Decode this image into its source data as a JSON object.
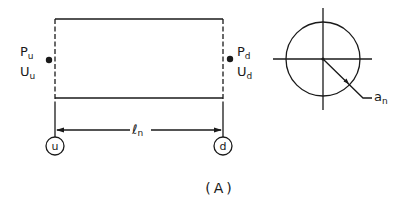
{
  "figure": {
    "caption": "(A)",
    "upstream": {
      "pressure_label": "P",
      "pressure_sub": "u",
      "velocity_label": "U",
      "velocity_sub": "u",
      "node_label": "u"
    },
    "downstream": {
      "pressure_label": "P",
      "pressure_sub": "d",
      "velocity_label": "U",
      "velocity_sub": "d",
      "node_label": "d"
    },
    "length_label": "ℓ",
    "length_sub": "n",
    "cross_section": {
      "radius_label": "a",
      "radius_sub": "n"
    }
  },
  "colors": {
    "ink": "#1a1a1a",
    "background": "#ffffff"
  }
}
